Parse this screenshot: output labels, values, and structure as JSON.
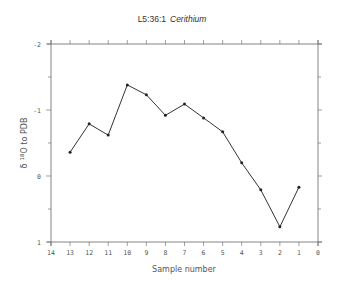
{
  "chart_data": {
    "type": "line",
    "title": "L5:36:1",
    "title_italic": "Cerithium",
    "xlabel": "Sample number",
    "ylabel_prefix": "δ",
    "ylabel_sup": "18",
    "ylabel_suffix": "O to PDB",
    "xlim": [
      14,
      0
    ],
    "ylim": [
      -2,
      1
    ],
    "y_inverted": true,
    "x_ticks": [
      14,
      13,
      12,
      11,
      10,
      9,
      8,
      7,
      6,
      5,
      4,
      3,
      2,
      1,
      0
    ],
    "x_tick_labels": [
      "14",
      "13",
      "12",
      "11",
      "10",
      "9",
      "8",
      "7",
      "6",
      "5",
      "4",
      "3",
      "2",
      "1",
      "0"
    ],
    "y_ticks": [
      -2,
      -1,
      0,
      1
    ],
    "y_tick_labels": [
      "-2",
      "-1",
      "0",
      "1"
    ],
    "y_minor_ticks": [
      -1.5,
      -0.5,
      0.5
    ],
    "grid": false,
    "series": [
      {
        "name": "Cerithium",
        "x": [
          13,
          12,
          11,
          10,
          9,
          8,
          7,
          6,
          5,
          4,
          3,
          2,
          1
        ],
        "y": [
          -0.36,
          -0.79,
          -0.62,
          -1.38,
          -1.23,
          -0.92,
          -1.09,
          -0.88,
          -0.67,
          -0.2,
          0.21,
          0.77,
          0.17
        ]
      }
    ]
  }
}
